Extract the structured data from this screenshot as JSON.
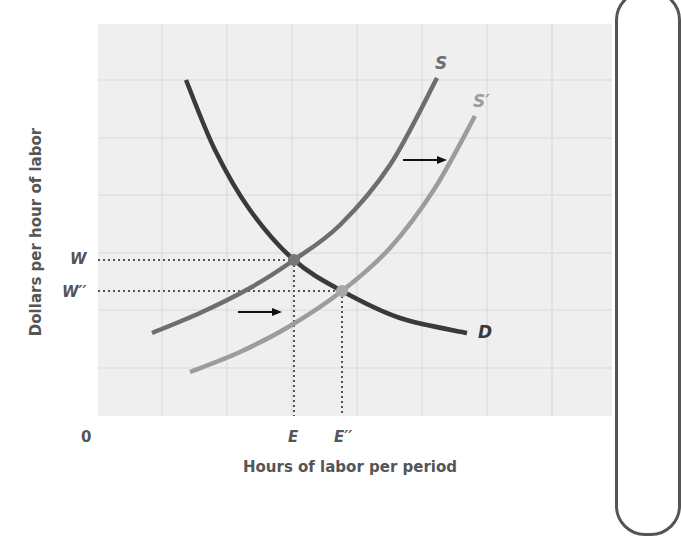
{
  "chart_data": {
    "type": "line",
    "title": "",
    "xlabel": "Hours of labor per period",
    "ylabel": "Dollars per hour of labor",
    "origin_label": "0",
    "grid": true,
    "x_ticks": [
      {
        "label": "E",
        "x": 294
      },
      {
        "label": "E′′",
        "x": 342
      }
    ],
    "y_ticks": [
      {
        "label": "W",
        "y": 260
      },
      {
        "label": "W′′",
        "y": 292
      }
    ],
    "series": [
      {
        "name": "D",
        "label": "D",
        "kind": "demand",
        "color": "#3a3a3a",
        "points": [
          [
            186,
            80
          ],
          [
            215,
            150
          ],
          [
            250,
            210
          ],
          [
            294,
            260
          ],
          [
            342,
            291
          ],
          [
            400,
            318
          ],
          [
            467,
            333
          ]
        ]
      },
      {
        "name": "S",
        "label": "S",
        "kind": "supply",
        "color": "#6e6e6e",
        "points": [
          [
            152,
            333
          ],
          [
            200,
            313
          ],
          [
            250,
            288
          ],
          [
            294,
            260
          ],
          [
            340,
            225
          ],
          [
            390,
            165
          ],
          [
            437,
            78
          ]
        ]
      },
      {
        "name": "S′",
        "label": "S′",
        "kind": "supply-shifted",
        "color": "#9c9c9c",
        "points": [
          [
            190,
            372
          ],
          [
            240,
            352
          ],
          [
            290,
            326
          ],
          [
            342,
            291
          ],
          [
            390,
            248
          ],
          [
            435,
            188
          ],
          [
            475,
            116
          ]
        ]
      }
    ],
    "equilibria": [
      {
        "name": "original",
        "x_label": "E",
        "y_label": "W",
        "x": 294,
        "y": 260
      },
      {
        "name": "new",
        "x_label": "E′′",
        "y_label": "W′′",
        "x": 342,
        "y": 291
      }
    ],
    "annotations": [
      {
        "type": "arrow",
        "direction": "right",
        "from": [
          403,
          160
        ],
        "to": [
          447,
          160
        ],
        "meaning": "supply shifts right"
      },
      {
        "type": "arrow",
        "direction": "right",
        "from": [
          238,
          312
        ],
        "to": [
          282,
          312
        ],
        "meaning": "supply shifts right"
      }
    ],
    "legend": "none (curves labeled directly)"
  },
  "colors": {
    "plot_bg": "#efefef",
    "grid": "#dadada",
    "demand": "#3a3a3a",
    "supply": "#6e6e6e",
    "supply_shifted": "#9c9c9c",
    "text": "#555555"
  }
}
